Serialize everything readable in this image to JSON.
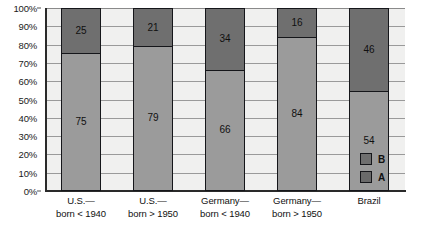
{
  "chart_data": {
    "type": "bar",
    "title": "",
    "subtitle": "",
    "xlabel": "",
    "ylabel": "",
    "stacked": true,
    "stack_mode": "percent",
    "grid": true,
    "legend_position": "right-inside-bottom",
    "ylim": [
      0,
      100
    ],
    "categories": [
      "U.S.—\nborn < 1940",
      "U.S.—\nborn > 1950",
      "Germany—\nborn < 1940",
      "Germany—\nborn > 1950",
      "Brazil"
    ],
    "category_lines": [
      [
        "U.S.—",
        "born < 1940"
      ],
      [
        "U.S.—",
        "born > 1950"
      ],
      [
        "Germany—",
        "born < 1940"
      ],
      [
        "Germany—",
        "born > 1950"
      ],
      [
        "Brazil",
        ""
      ]
    ],
    "series": [
      {
        "name": "A",
        "color": "#9b9b9b",
        "values": [
          75,
          79,
          66,
          84,
          54
        ]
      },
      {
        "name": "B",
        "color": "#6f6f6f",
        "values": [
          25,
          21,
          34,
          16,
          46
        ]
      }
    ],
    "ytick_labels": [
      "100%",
      "90%",
      "80%",
      "70%",
      "60%",
      "50%",
      "40%",
      "30%",
      "20%",
      "10%",
      "0%"
    ],
    "ytick_values": [
      100,
      90,
      80,
      70,
      60,
      50,
      40,
      30,
      20,
      10,
      0
    ]
  },
  "legend": {
    "items": [
      {
        "label": "B",
        "color": "#6f6f6f"
      },
      {
        "label": "A",
        "color": "#6a6a6a"
      }
    ]
  },
  "caption": {
    "fragment": ""
  }
}
